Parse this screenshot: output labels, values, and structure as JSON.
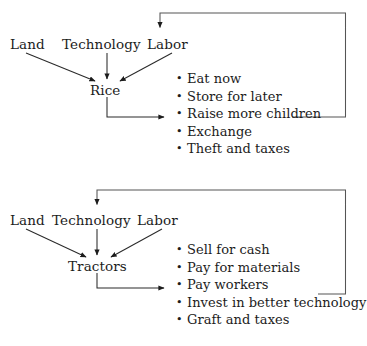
{
  "figure": {
    "kind": "flow-diagram",
    "background_color": "#ffffff",
    "line_color": "#555555",
    "text_color": "#1c1c1c"
  },
  "diagrams": [
    {
      "id": "rice-system",
      "inputs": [
        {
          "label": "Land"
        },
        {
          "label": "Technology"
        },
        {
          "label": "Labor"
        }
      ],
      "output": {
        "label": "Rice"
      },
      "uses": [
        {
          "label": "Eat now"
        },
        {
          "label": "Store for later"
        },
        {
          "label": "Raise more children"
        },
        {
          "label": "Exchange"
        },
        {
          "label": "Theft and taxes"
        }
      ],
      "feedback": {
        "from": "Raise more children",
        "to": "Labor"
      }
    },
    {
      "id": "tractor-system",
      "inputs": [
        {
          "label": "Land"
        },
        {
          "label": "Technology"
        },
        {
          "label": "Labor"
        }
      ],
      "output": {
        "label": "Tractors"
      },
      "uses": [
        {
          "label": "Sell for cash"
        },
        {
          "label": "Pay for materials"
        },
        {
          "label": "Pay workers"
        },
        {
          "label": "Invest in better technology"
        },
        {
          "label": "Graft and taxes"
        }
      ],
      "feedback": {
        "from": "Invest in better technology",
        "to": "Technology"
      }
    }
  ]
}
